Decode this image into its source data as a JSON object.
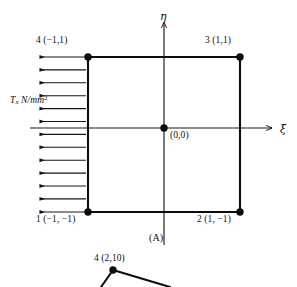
{
  "figure": {
    "panel_label": "(A)",
    "axes": {
      "vertical_label": "η",
      "horizontal_label": "ξ"
    },
    "traction_label": {
      "symbol": "T",
      "subscript": "x",
      "units": "N/mm",
      "exponent": "2"
    },
    "nodes": [
      {
        "name": "node-4-top-left",
        "label": "4 (−1,1)"
      },
      {
        "name": "node-3-top-right",
        "label": "3 (1,1)"
      },
      {
        "name": "node-1-bottom-left",
        "label": "1 (−1, −1)"
      },
      {
        "name": "node-2-bottom-right",
        "label": "2 (1, −1)"
      },
      {
        "name": "node-origin",
        "label": "(0,0)"
      }
    ],
    "lower_figure": {
      "node_label": "4 (2,10)"
    },
    "colors": {
      "background": "#ffffff",
      "ink": "#111111",
      "axis": "#1a1a1a",
      "element_edge": "#0d0d0d",
      "arrow": "#151515"
    },
    "geometry": {
      "square": {
        "left": 88,
        "top": 57,
        "right": 240,
        "bottom": 212
      },
      "origin": {
        "x": 164,
        "y": 128
      },
      "traction_arrow_count": 13,
      "traction_arrow_tail_x": 38,
      "traction_arrow_head_x": 86
    }
  }
}
